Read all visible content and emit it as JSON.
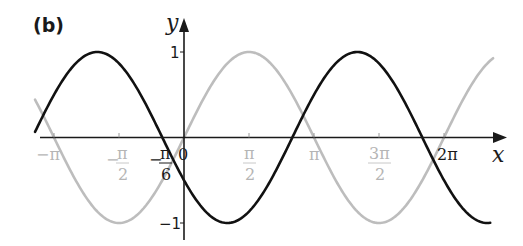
{
  "panel_label": "(b)",
  "colors": {
    "axis": "#1a1a1a",
    "black_curve": "#111111",
    "grey_curve": "#bdbdbd",
    "grey_label": "#b5b5b5"
  },
  "chart_data": {
    "type": "line",
    "title": "(b)",
    "xlabel": "x",
    "ylabel": "y",
    "xlim": [
      -3.6,
      7.47
    ],
    "ylim": [
      -1.15,
      1.4
    ],
    "grid": false,
    "legend": null,
    "x_ticks": [
      {
        "value": -3.1416,
        "label": "−π",
        "style": "grey"
      },
      {
        "value": -1.5708,
        "label": "−π/2",
        "style": "grey"
      },
      {
        "value": -0.5236,
        "label": "−π/6",
        "style": "black"
      },
      {
        "value": 0,
        "label": "0",
        "style": "black"
      },
      {
        "value": 1.5708,
        "label": "π/2",
        "style": "grey"
      },
      {
        "value": 3.1416,
        "label": "π",
        "style": "grey"
      },
      {
        "value": 4.7124,
        "label": "3π/2",
        "style": "grey"
      },
      {
        "value": 6.2832,
        "label": "2π",
        "style": "black"
      }
    ],
    "y_ticks": [
      {
        "value": 1,
        "label": "1"
      },
      {
        "value": -1,
        "label": "−1"
      }
    ],
    "series": [
      {
        "name": "y = sin x",
        "color": "#bdbdbd",
        "function": "sin(x)",
        "x_range": [
          -3.6,
          7.47
        ],
        "key_points": [
          {
            "x": -3.1416,
            "y": 0
          },
          {
            "x": -1.5708,
            "y": -1
          },
          {
            "x": 0,
            "y": 0
          },
          {
            "x": 1.5708,
            "y": 1
          },
          {
            "x": 3.1416,
            "y": 0
          },
          {
            "x": 4.7124,
            "y": -1
          },
          {
            "x": 6.2832,
            "y": 0
          }
        ]
      },
      {
        "name": "y = −sin(x + π/6)",
        "color": "#111111",
        "function": "-sin(x + pi/6)",
        "x_range": [
          -3.6,
          7.4
        ],
        "key_points": [
          {
            "x": -2.0944,
            "y": 1
          },
          {
            "x": -0.5236,
            "y": 0
          },
          {
            "x": 1.0472,
            "y": -1
          },
          {
            "x": 2.618,
            "y": 0
          },
          {
            "x": 4.1888,
            "y": 1
          },
          {
            "x": 5.7596,
            "y": 0
          },
          {
            "x": 7.3304,
            "y": -1
          }
        ]
      }
    ]
  },
  "labels": {
    "y_axis": "y",
    "x_axis": "x",
    "y_tick_1": "1",
    "y_tick_neg1": "−1",
    "x_neg_pi": "−π",
    "x_neg_pi_half_num": "π",
    "x_neg_pi_half_den": "2",
    "x_neg_pi_half_sign": "−",
    "x_neg_pi_sixth_sign": "−",
    "x_neg_pi_sixth_num": "π",
    "x_neg_pi_sixth_den": "6",
    "x_zero": "0",
    "x_pi_half_num": "π",
    "x_pi_half_den": "2",
    "x_pi": "π",
    "x_3pi_half_num": "3π",
    "x_3pi_half_den": "2",
    "x_2pi": "2π"
  }
}
